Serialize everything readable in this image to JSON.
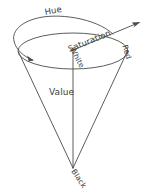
{
  "figure": {
    "name": "hsv-color-cone-diagram",
    "background_color": "#ffffff",
    "stroke_color": "#4a4a4a",
    "text_color": "#3d3d3d",
    "width": 146,
    "height": 196
  },
  "labels": {
    "hue": "Hue",
    "saturation": "Saturation",
    "white": "White",
    "red": "Red",
    "value": "Value",
    "black": "Black"
  },
  "geometry": {
    "ellipse_center_x": 73,
    "ellipse_center_y": 51,
    "ellipse_radius_x": 55,
    "ellipse_radius_y": 18,
    "apex_x": 73,
    "apex_y": 168,
    "hue_arc_description": "counter-clockwise arrow arc above and around the top ellipse",
    "saturation_arrow_tip_x": 140,
    "saturation_arrow_tip_y": 22
  }
}
